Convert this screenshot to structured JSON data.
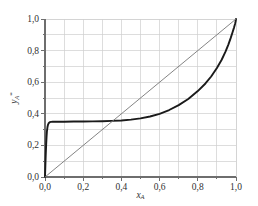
{
  "chart_data": {
    "type": "line",
    "title": "",
    "xlabel": "x_A",
    "ylabel": "y_A*",
    "xlabel_base": "x",
    "xlabel_sub": "A",
    "ylabel_base": "y",
    "ylabel_sub": "A",
    "ylabel_sup": "*",
    "xlim": [
      0.0,
      1.0
    ],
    "ylim": [
      0.0,
      1.0
    ],
    "grid": true,
    "grid_step": 0.1,
    "legend": "none",
    "x_ticks": [
      0.0,
      0.2,
      0.4,
      0.6,
      0.8,
      1.0
    ],
    "y_ticks": [
      0.0,
      0.2,
      0.4,
      0.6,
      0.8,
      1.0
    ],
    "x_tick_labels": [
      "0,0",
      "0,2",
      "0,4",
      "0,6",
      "0,8",
      "1,0"
    ],
    "y_tick_labels": [
      "0,0",
      "0,2",
      "0,4",
      "0,6",
      "0,8",
      "1,0"
    ],
    "minor_tick_step": 0.1,
    "decimal_separator": ",",
    "azeotrope_x": 0.35,
    "azeotrope_y": 0.35,
    "plateau_value": 0.355,
    "colors": {
      "equilibrium_curve": "#1a1a1a",
      "diagonal_line": "#767676",
      "grid": "#cfcfcf",
      "axis": "#6e6e6e",
      "text": "#313131",
      "background": "#ffffff"
    },
    "series": [
      {
        "name": "equilibrium-curve",
        "color": "#1a1a1a",
        "width": 1.9,
        "points": [
          [
            0.0,
            0.0
          ],
          [
            0.002,
            0.075
          ],
          [
            0.004,
            0.145
          ],
          [
            0.006,
            0.205
          ],
          [
            0.008,
            0.252
          ],
          [
            0.01,
            0.288
          ],
          [
            0.013,
            0.316
          ],
          [
            0.016,
            0.332
          ],
          [
            0.02,
            0.342
          ],
          [
            0.025,
            0.347
          ],
          [
            0.032,
            0.349
          ],
          [
            0.04,
            0.35
          ],
          [
            0.06,
            0.35
          ],
          [
            0.08,
            0.35
          ],
          [
            0.1,
            0.35
          ],
          [
            0.15,
            0.351
          ],
          [
            0.2,
            0.351
          ],
          [
            0.25,
            0.352
          ],
          [
            0.3,
            0.353
          ],
          [
            0.35,
            0.355
          ],
          [
            0.4,
            0.358
          ],
          [
            0.45,
            0.363
          ],
          [
            0.5,
            0.371
          ],
          [
            0.55,
            0.383
          ],
          [
            0.6,
            0.4
          ],
          [
            0.65,
            0.424
          ],
          [
            0.7,
            0.455
          ],
          [
            0.75,
            0.494
          ],
          [
            0.8,
            0.544
          ],
          [
            0.84,
            0.592
          ],
          [
            0.87,
            0.636
          ],
          [
            0.9,
            0.69
          ],
          [
            0.925,
            0.742
          ],
          [
            0.945,
            0.793
          ],
          [
            0.96,
            0.838
          ],
          [
            0.972,
            0.879
          ],
          [
            0.982,
            0.916
          ],
          [
            0.99,
            0.947
          ],
          [
            0.995,
            0.969
          ],
          [
            0.998,
            0.985
          ],
          [
            1.0,
            1.0
          ]
        ]
      },
      {
        "name": "diagonal-reference-line",
        "color": "#767676",
        "width": 0.9,
        "points": [
          [
            0.0,
            0.0
          ],
          [
            1.0,
            1.0
          ]
        ]
      }
    ]
  }
}
